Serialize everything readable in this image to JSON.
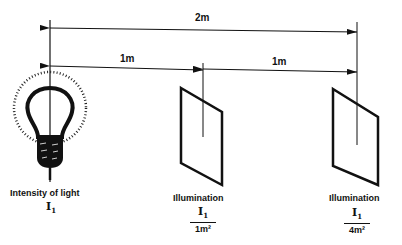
{
  "diagram": {
    "dimensions": {
      "total": "2m",
      "first_segment": "1m",
      "second_segment": "1m"
    },
    "source": {
      "label": "Intensity of light",
      "symbol": "I",
      "subscript": "1"
    },
    "surface_1": {
      "label": "Illumination",
      "numerator": "I",
      "numerator_sub": "1",
      "denominator": "1m²"
    },
    "surface_2": {
      "label": "Illumination",
      "numerator": "I",
      "numerator_sub": "1",
      "denominator": "4m²"
    }
  }
}
